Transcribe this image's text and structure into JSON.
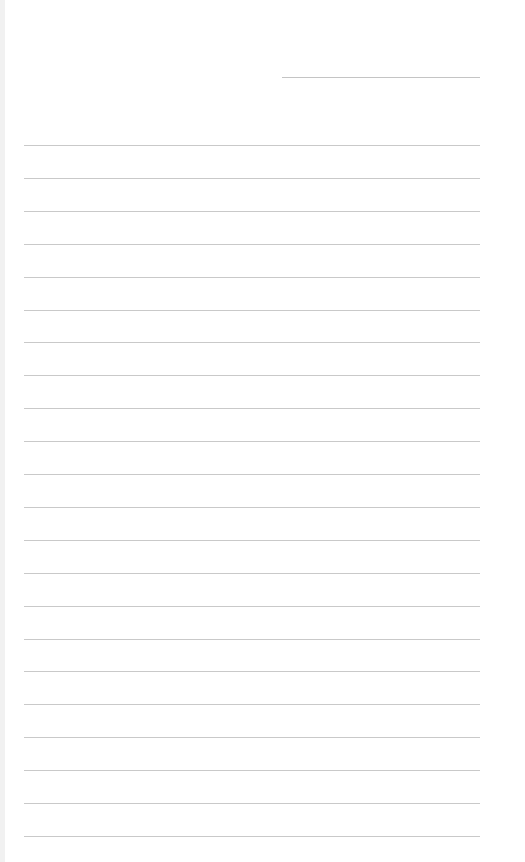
{
  "page": {
    "type": "lined-paper",
    "background": "#ffffff",
    "line_color": "#c9c9c9",
    "header_line": {
      "top": 77,
      "left": 282,
      "width": 198
    },
    "rules": {
      "count": 22,
      "first_top": 145,
      "spacing": 32.9,
      "left": 24,
      "width": 456
    }
  }
}
